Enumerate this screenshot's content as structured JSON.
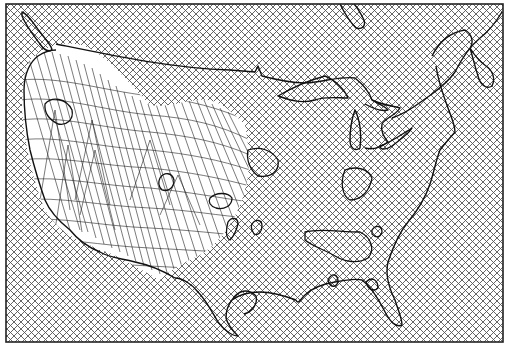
{
  "map": {
    "subject": "Contiguous United States surface plot over crosshatched grid",
    "frame": {
      "x": 6,
      "y": 4,
      "width": 497,
      "height": 338
    },
    "colors": {
      "background": "#ffffff",
      "hatch": "#555555",
      "outline": "#111111",
      "mesh": "#222222"
    },
    "layers": [
      {
        "name": "crosshatch-grid",
        "label": "Diagonal crosshatch grid"
      },
      {
        "name": "coastline-borders",
        "label": "US coastline, Great Lakes and Canada border"
      },
      {
        "name": "contour-islands",
        "label": "Closed contour outlines"
      },
      {
        "name": "wireframe-surface",
        "label": "3D wireframe relief over western US"
      }
    ]
  }
}
